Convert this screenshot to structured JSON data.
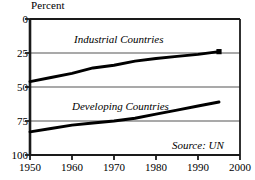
{
  "chart_data": {
    "type": "line",
    "title": "",
    "ylabel": "Percent",
    "xlabel": "",
    "xlim": [
      1950,
      2000
    ],
    "ylim": [
      0,
      100
    ],
    "xticks": [
      1950,
      1960,
      1970,
      1980,
      1990,
      2000
    ],
    "yticks": [
      0,
      25,
      50,
      75,
      100
    ],
    "grid": "horizontal",
    "legend_position": "inline-annotation",
    "annotations": [
      {
        "text": "Source: UN",
        "x": 1988,
        "y": 6
      }
    ],
    "series": [
      {
        "name": "Industrial Countries",
        "label_x": 1960,
        "label_y": 82,
        "end_marker": "square",
        "x": [
          1950,
          1955,
          1960,
          1965,
          1970,
          1975,
          1980,
          1985,
          1990,
          1995
        ],
        "values": [
          54,
          57,
          60,
          64,
          66,
          69,
          71,
          72.5,
          74,
          76
        ]
      },
      {
        "name": "Developing Countries",
        "label_x": 1960,
        "label_y": 43,
        "end_marker": "none",
        "x": [
          1950,
          1955,
          1960,
          1965,
          1970,
          1975,
          1980,
          1985,
          1990,
          1995
        ],
        "values": [
          17,
          19.5,
          22,
          23.5,
          25,
          27,
          30,
          33,
          36,
          39
        ]
      }
    ]
  },
  "axis": {
    "y_label": "Percent",
    "y_tick_labels": [
      "100",
      "75",
      "50",
      "25",
      "0"
    ],
    "x_tick_labels": [
      "1950",
      "1960",
      "1970",
      "1980",
      "1990",
      "2000"
    ]
  },
  "labels": {
    "industrial": "Industrial Countries",
    "developing": "Developing Countries",
    "source": "Source: UN"
  },
  "colors": {
    "line": "#000000",
    "grid": "#8c8c8c",
    "frame": "#1a1a1a",
    "background": "#ffffff",
    "text": "#000000"
  }
}
